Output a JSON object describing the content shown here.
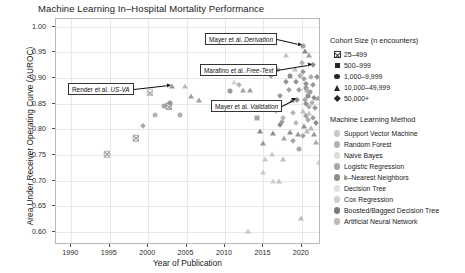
{
  "chart_data": {
    "type": "scatter",
    "title": "Machine Learning In–Hospital Mortality Performance",
    "xlabel": "Year of Publication",
    "ylabel": "Area Under Receiver Operating Curve (AUROC)",
    "xlim": [
      1988,
      2022.5
    ],
    "ylim": [
      0.575,
      1.015
    ],
    "xticks": [
      1990,
      1995,
      2000,
      2005,
      2010,
      2015,
      2020
    ],
    "yticks": [
      0.6,
      0.65,
      0.7,
      0.75,
      0.8,
      0.85,
      0.9,
      0.95,
      1.0
    ],
    "ytick_labels": [
      "0.60",
      "0.65",
      "0.70",
      "0.75",
      "0.80",
      "0.85",
      "0.90",
      "0.95",
      "1.00"
    ],
    "xtick_labels": [
      "1990",
      "1995",
      "2000",
      "2005",
      "2010",
      "2015",
      "2020"
    ],
    "grid": true,
    "legend_position": "right",
    "legends": [
      {
        "title": "Cohort Size (n encounters)",
        "entries": [
          {
            "label": "25–499",
            "marker": "crossed-square"
          },
          {
            "label": "500–999",
            "marker": "square"
          },
          {
            "label": "1,000–9,999",
            "marker": "circle"
          },
          {
            "label": "10,000–49,999",
            "marker": "triangle"
          },
          {
            "label": "50,000+",
            "marker": "diamond"
          }
        ]
      },
      {
        "title": "Machine Learning Method",
        "entries": [
          {
            "label": "Support Vector Machine",
            "color": "#c9c9c9"
          },
          {
            "label": "Random Forest",
            "color": "#b4b4b4"
          },
          {
            "label": "Naive Bayes",
            "color": "#dcdcdc"
          },
          {
            "label": "Logistic Regression",
            "color": "#a8a8a8"
          },
          {
            "label": "k–Nearest Neighbors",
            "color": "#8d8d8d"
          },
          {
            "label": "Decision Tree",
            "color": "#e2e2e2"
          },
          {
            "label": "Cox Regression",
            "color": "#cfcfcf"
          },
          {
            "label": "Boosted/Bagged Decision Tree",
            "color": "#7d7d7d"
          },
          {
            "label": "Artificial Neural Network",
            "color": "#b9b9b9"
          }
        ]
      }
    ],
    "annotations": [
      {
        "id": "mayer-derivation",
        "text_plain": "Mayer et al. Derivation",
        "text_roman": "Mayer et al. ",
        "text_italic": "Derivation",
        "target_x": 2020.1,
        "target_y": 0.963
      },
      {
        "id": "marafino-freetext",
        "text_plain": "Marafino et al. Free-Text",
        "text_roman": "Marafino et al. ",
        "text_italic": "Free-Text",
        "target_x": 2021.4,
        "target_y": 0.925
      },
      {
        "id": "render-usva",
        "text_plain": "Render et al. US-VA",
        "text_roman": "Render et al. ",
        "text_italic": "US-VA",
        "target_x": 2003.1,
        "target_y": 0.885
      },
      {
        "id": "mayer-validation",
        "text_plain": "Mayer et al. Validation",
        "text_roman": "Mayer et al. ",
        "text_italic": "Validation",
        "target_x": 2019.4,
        "target_y": 0.858
      }
    ],
    "points": [
      {
        "x": 1994.6,
        "y": 0.752,
        "marker": "crossed-square",
        "color": "#b0b0b0"
      },
      {
        "x": 1999.3,
        "y": 0.806,
        "marker": "diamond",
        "color": "#a9a9a9"
      },
      {
        "x": 2000.9,
        "y": 0.829,
        "marker": "circle",
        "color": "#b2b2b2"
      },
      {
        "x": 2000.2,
        "y": 0.872,
        "marker": "crossed-square",
        "color": "#c2c2c2"
      },
      {
        "x": 2002.1,
        "y": 0.845,
        "marker": "circle",
        "color": "#a5a5a5"
      },
      {
        "x": 2002.9,
        "y": 0.852,
        "marker": "circle",
        "color": "#9c9c9c"
      },
      {
        "x": 2002.7,
        "y": 0.845,
        "marker": "crossed-square",
        "color": "#8f8f8f"
      },
      {
        "x": 2003.1,
        "y": 0.885,
        "marker": "triangle",
        "color": "#9a9a9a"
      },
      {
        "x": 2004.1,
        "y": 0.829,
        "marker": "circle",
        "color": "#aeaeae"
      },
      {
        "x": 2004.8,
        "y": 0.884,
        "marker": "triangle",
        "color": "#bbbbbb"
      },
      {
        "x": 2005.6,
        "y": 0.866,
        "marker": "triangle",
        "color": "#9f9f9f"
      },
      {
        "x": 2006.6,
        "y": 0.858,
        "marker": "triangle",
        "color": "#a0a0a0"
      },
      {
        "x": 1998.4,
        "y": 0.783,
        "marker": "crossed-square",
        "color": "#a6a6a6"
      },
      {
        "x": 2010.7,
        "y": 0.875,
        "marker": "circle",
        "color": "#9b9b9b"
      },
      {
        "x": 2011.2,
        "y": 0.893,
        "marker": "triangle",
        "color": "#d3d3d3"
      },
      {
        "x": 2011.8,
        "y": 0.886,
        "marker": "diamond",
        "color": "#b6b6b6"
      },
      {
        "x": 2012.4,
        "y": 0.876,
        "marker": "triangle",
        "color": "#a4a4a4"
      },
      {
        "x": 2013.2,
        "y": 0.876,
        "marker": "triangle",
        "color": "#9d9d9d"
      },
      {
        "x": 2013.0,
        "y": 0.603,
        "marker": "triangle",
        "color": "#c6c6c6"
      },
      {
        "x": 2014.2,
        "y": 0.822,
        "marker": "square",
        "color": "#a3a3a3"
      },
      {
        "x": 2014.6,
        "y": 0.797,
        "marker": "triangle",
        "color": "#8b8b8b"
      },
      {
        "x": 2014.9,
        "y": 0.773,
        "marker": "triangle",
        "color": "#979797"
      },
      {
        "x": 2015.2,
        "y": 0.742,
        "marker": "triangle",
        "color": "#c8c8c8"
      },
      {
        "x": 2015.4,
        "y": 0.845,
        "marker": "diamond",
        "color": "#a7a7a7"
      },
      {
        "x": 2015.8,
        "y": 0.852,
        "marker": "diamond",
        "color": "#b0b0b0"
      },
      {
        "x": 2016.0,
        "y": 0.905,
        "marker": "diamond",
        "color": "#9e9e9e"
      },
      {
        "x": 2016.3,
        "y": 0.793,
        "marker": "triangle",
        "color": "#8d8d8d"
      },
      {
        "x": 2016.1,
        "y": 0.752,
        "marker": "triangle",
        "color": "#cacaca"
      },
      {
        "x": 2016.6,
        "y": 0.836,
        "marker": "diamond",
        "color": "#b8b8b8"
      },
      {
        "x": 2016.9,
        "y": 0.915,
        "marker": "diamond",
        "color": "#aaaaaa"
      },
      {
        "x": 2017.1,
        "y": 0.866,
        "marker": "diamond",
        "color": "#999999"
      },
      {
        "x": 2017.4,
        "y": 0.815,
        "marker": "diamond",
        "color": "#a2a2a2"
      },
      {
        "x": 2017.2,
        "y": 0.808,
        "marker": "diamond",
        "color": "#8c8c8c"
      },
      {
        "x": 2017.6,
        "y": 0.823,
        "marker": "diamond",
        "color": "#b3b3b3"
      },
      {
        "x": 2017.9,
        "y": 0.945,
        "marker": "triangle",
        "color": "#c5c5c5"
      },
      {
        "x": 2017.7,
        "y": 0.784,
        "marker": "triangle",
        "color": "#a8a8a8"
      },
      {
        "x": 2017.5,
        "y": 0.742,
        "marker": "triangle",
        "color": "#bfbfbf"
      },
      {
        "x": 2018.0,
        "y": 0.893,
        "marker": "diamond",
        "color": "#949494"
      },
      {
        "x": 2018.3,
        "y": 0.876,
        "marker": "diamond",
        "color": "#a1a1a1"
      },
      {
        "x": 2018.5,
        "y": 0.905,
        "marker": "circle",
        "color": "#8e8e8e"
      },
      {
        "x": 2018.7,
        "y": 0.858,
        "marker": "triangle",
        "color": "#9b9b9b"
      },
      {
        "x": 2018.9,
        "y": 0.832,
        "marker": "diamond",
        "color": "#b5b5b5"
      },
      {
        "x": 2018.4,
        "y": 0.795,
        "marker": "triangle",
        "color": "#909090"
      },
      {
        "x": 2018.8,
        "y": 0.778,
        "marker": "diamond",
        "color": "#a5a5a5"
      },
      {
        "x": 2019.1,
        "y": 0.917,
        "marker": "triangle",
        "color": "#c0c0c0"
      },
      {
        "x": 2019.3,
        "y": 0.893,
        "marker": "diamond",
        "color": "#929292"
      },
      {
        "x": 2019.4,
        "y": 0.858,
        "marker": "diamond",
        "color": "#878787"
      },
      {
        "x": 2019.6,
        "y": 0.876,
        "marker": "diamond",
        "color": "#9d9d9d"
      },
      {
        "x": 2019.8,
        "y": 0.905,
        "marker": "diamond",
        "color": "#acacac"
      },
      {
        "x": 2019.2,
        "y": 0.812,
        "marker": "diamond",
        "color": "#b7b7b7"
      },
      {
        "x": 2019.5,
        "y": 0.792,
        "marker": "triangle",
        "color": "#989898"
      },
      {
        "x": 2019.7,
        "y": 0.762,
        "marker": "circle",
        "color": "#a9a9a9"
      },
      {
        "x": 2020.1,
        "y": 0.963,
        "marker": "circle",
        "color": "#a0a0a0"
      },
      {
        "x": 2020.4,
        "y": 0.952,
        "marker": "triangle",
        "color": "#8a8a8a"
      },
      {
        "x": 2020.0,
        "y": 0.929,
        "marker": "diamond",
        "color": "#b1b1b1"
      },
      {
        "x": 2020.2,
        "y": 0.912,
        "marker": "diamond",
        "color": "#969696"
      },
      {
        "x": 2020.3,
        "y": 0.898,
        "marker": "diamond",
        "color": "#a3a3a3"
      },
      {
        "x": 2020.5,
        "y": 0.889,
        "marker": "diamond",
        "color": "#8d8d8d"
      },
      {
        "x": 2020.6,
        "y": 0.881,
        "marker": "circle",
        "color": "#9a9a9a"
      },
      {
        "x": 2020.7,
        "y": 0.874,
        "marker": "diamond",
        "color": "#b4b4b4"
      },
      {
        "x": 2020.8,
        "y": 0.866,
        "marker": "circle",
        "color": "#8f8f8f"
      },
      {
        "x": 2020.4,
        "y": 0.858,
        "marker": "diamond",
        "color": "#a6a6a6"
      },
      {
        "x": 2020.6,
        "y": 0.849,
        "marker": "diamond",
        "color": "#939393"
      },
      {
        "x": 2020.9,
        "y": 0.843,
        "marker": "diamond",
        "color": "#aeaeae"
      },
      {
        "x": 2020.2,
        "y": 0.836,
        "marker": "triangle",
        "color": "#bdbdbd"
      },
      {
        "x": 2020.5,
        "y": 0.826,
        "marker": "diamond",
        "color": "#9c9c9c"
      },
      {
        "x": 2020.8,
        "y": 0.818,
        "marker": "diamond",
        "color": "#a7a7a7"
      },
      {
        "x": 2020.3,
        "y": 0.806,
        "marker": "triangle",
        "color": "#919191"
      },
      {
        "x": 2020.7,
        "y": 0.797,
        "marker": "triangle",
        "color": "#b9b9b9"
      },
      {
        "x": 2020.1,
        "y": 0.788,
        "marker": "diamond",
        "color": "#a4a4a4"
      },
      {
        "x": 2021.4,
        "y": 0.925,
        "marker": "diamond",
        "color": "#8b8b8b"
      },
      {
        "x": 2021.0,
        "y": 0.944,
        "marker": "triangle",
        "color": "#9f9f9f"
      },
      {
        "x": 2021.2,
        "y": 0.902,
        "marker": "diamond",
        "color": "#adadad"
      },
      {
        "x": 2021.5,
        "y": 0.886,
        "marker": "diamond",
        "color": "#959595"
      },
      {
        "x": 2021.1,
        "y": 0.872,
        "marker": "circle",
        "color": "#a2a2a2"
      },
      {
        "x": 2021.6,
        "y": 0.862,
        "marker": "diamond",
        "color": "#8e8e8e"
      },
      {
        "x": 2021.3,
        "y": 0.851,
        "marker": "diamond",
        "color": "#b2b2b2"
      },
      {
        "x": 2021.7,
        "y": 0.842,
        "marker": "diamond",
        "color": "#999999"
      },
      {
        "x": 2021.0,
        "y": 0.832,
        "marker": "triangle",
        "color": "#c3c3c3"
      },
      {
        "x": 2021.4,
        "y": 0.822,
        "marker": "diamond",
        "color": "#a1a1a1"
      },
      {
        "x": 2021.8,
        "y": 0.812,
        "marker": "diamond",
        "color": "#8c8c8c"
      },
      {
        "x": 2021.2,
        "y": 0.802,
        "marker": "triangle",
        "color": "#b6b6b6"
      },
      {
        "x": 2021.6,
        "y": 0.792,
        "marker": "triangle",
        "color": "#979797"
      },
      {
        "x": 2021.9,
        "y": 0.776,
        "marker": "triangle",
        "color": "#ababab"
      },
      {
        "x": 2022.1,
        "y": 0.862,
        "marker": "triangle",
        "color": "#a0a0a0"
      },
      {
        "x": 2022.0,
        "y": 0.902,
        "marker": "diamond",
        "color": "#909090"
      },
      {
        "x": 2022.2,
        "y": 0.737,
        "marker": "triangle",
        "color": "#c7c7c7"
      },
      {
        "x": 2019.9,
        "y": 0.628,
        "marker": "triangle",
        "color": "#bcbcbc"
      },
      {
        "x": 2016.2,
        "y": 0.7,
        "marker": "triangle",
        "color": "#d0d0d0"
      },
      {
        "x": 2017.0,
        "y": 0.7,
        "marker": "triangle",
        "color": "#c4c4c4"
      },
      {
        "x": 2015.0,
        "y": 0.718,
        "marker": "triangle",
        "color": "#cdcdcd"
      }
    ]
  }
}
